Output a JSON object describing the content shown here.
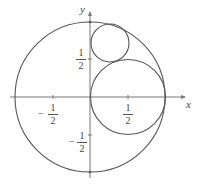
{
  "axes": {
    "x_label": "x",
    "y_label": "y"
  },
  "ticks": {
    "x_pos": {
      "num": "1",
      "den": "2"
    },
    "x_neg": {
      "sign": "−",
      "num": "1",
      "den": "2"
    },
    "y_pos": {
      "num": "1",
      "den": "2"
    },
    "y_neg": {
      "sign": "−",
      "num": "1",
      "den": "2"
    }
  },
  "circles": [
    {
      "name": "unit circle",
      "cx": 0,
      "cy": 0,
      "r": 1
    },
    {
      "name": "medium circle",
      "cx": 0.5,
      "cy": 0,
      "r": 0.5
    },
    {
      "name": "small circle",
      "cx": 0.25,
      "cy": 0.72,
      "r": 0.25
    }
  ]
}
